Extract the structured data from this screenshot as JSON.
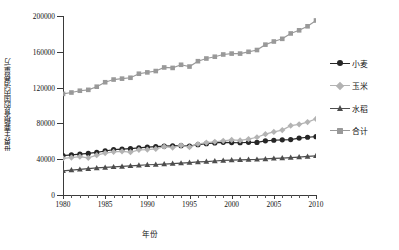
{
  "chart_data": {
    "type": "line",
    "title": "",
    "xlabel": "年份",
    "ylabel": "世界主要粮食的国内消费量/万",
    "xlim": [
      1980,
      2010
    ],
    "ylim": [
      0,
      200000
    ],
    "xticks": [
      1980,
      1985,
      1990,
      1995,
      2000,
      2005,
      2010
    ],
    "yticks": [
      0,
      40000,
      80000,
      120000,
      160000,
      200000
    ],
    "ytick_labels": [
      "0",
      "40000",
      "80000",
      "120000",
      "160000",
      "200000"
    ],
    "xtick_labels": [
      "1980",
      "1985",
      "1990",
      "1995",
      "2000",
      "2005",
      "2010"
    ],
    "grid": false,
    "legend_position": "right",
    "x": [
      1980,
      1981,
      1982,
      1983,
      1984,
      1985,
      1986,
      1987,
      1988,
      1989,
      1990,
      1991,
      1992,
      1993,
      1994,
      1995,
      1996,
      1997,
      1998,
      1999,
      2000,
      2001,
      2002,
      2003,
      2004,
      2005,
      2006,
      2007,
      2008,
      2009,
      2010
    ],
    "series": [
      {
        "name": "小麦",
        "color": "#262626",
        "marker": "circle",
        "values": [
          44000,
          44800,
          45600,
          46500,
          47600,
          49200,
          50600,
          51200,
          51800,
          52600,
          53400,
          54000,
          54600,
          54900,
          55100,
          54700,
          56200,
          57400,
          58200,
          58800,
          58600,
          58400,
          58900,
          58700,
          60500,
          61200,
          61600,
          61900,
          63600,
          64500,
          65200
        ]
      },
      {
        "name": "玉米",
        "color": "#b3b3b3",
        "marker": "diamond",
        "values": [
          41000,
          41800,
          42800,
          41500,
          44500,
          46800,
          48200,
          48800,
          47800,
          50500,
          50800,
          51500,
          54000,
          53000,
          55500,
          53500,
          57000,
          58500,
          59500,
          60500,
          61500,
          61000,
          62500,
          64500,
          68000,
          70500,
          72500,
          77500,
          79000,
          81500,
          85000
        ]
      },
      {
        "name": "水稻",
        "color": "#4d4d4d",
        "marker": "triangle",
        "values": [
          27000,
          27800,
          28600,
          29400,
          30200,
          30800,
          31400,
          31900,
          32500,
          33200,
          33800,
          34100,
          34600,
          35100,
          35600,
          36200,
          36900,
          37400,
          38000,
          38600,
          39000,
          39300,
          39600,
          39800,
          40300,
          40900,
          41300,
          41800,
          42400,
          43100,
          43800
        ]
      },
      {
        "name": "合计",
        "color": "#999999",
        "marker": "square",
        "values": [
          113000,
          114500,
          116500,
          117500,
          121000,
          126000,
          129000,
          130000,
          131000,
          135500,
          137000,
          138500,
          142500,
          142000,
          145500,
          143500,
          149500,
          152500,
          154500,
          157000,
          158000,
          158000,
          160000,
          162000,
          168000,
          171500,
          174500,
          180500,
          184000,
          188500,
          195000
        ]
      }
    ]
  },
  "legend": {
    "items": [
      {
        "label": "小麦"
      },
      {
        "label": "玉米"
      },
      {
        "label": "水稻"
      },
      {
        "label": "合计"
      }
    ]
  }
}
